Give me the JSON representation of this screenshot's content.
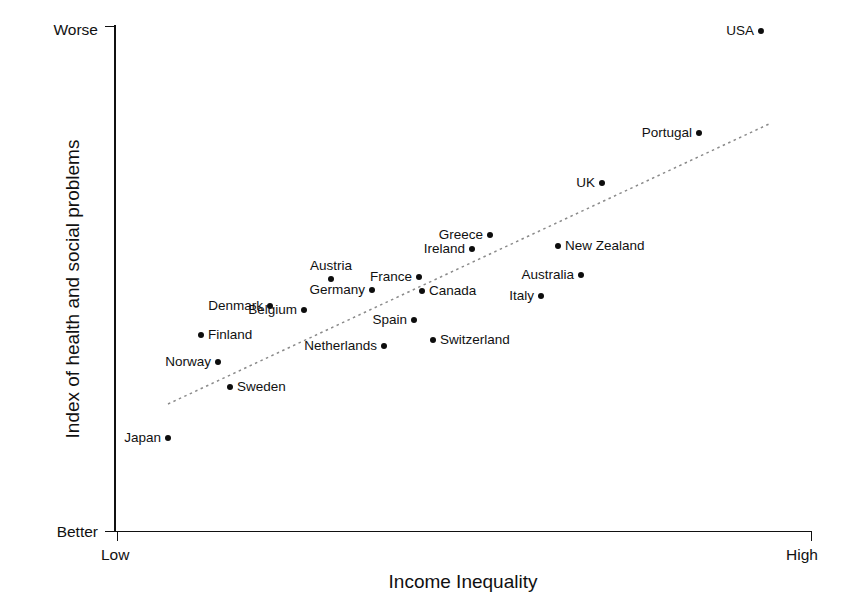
{
  "chart_data": {
    "type": "scatter",
    "title": "",
    "xlabel": "Income Inequality",
    "ylabel": "Index of health and social problems",
    "x_tick_labels": [
      "Low",
      "High"
    ],
    "y_tick_labels": [
      "Better",
      "Worse"
    ],
    "x_axis_direction": "Low to High",
    "y_axis_direction": "Better to Worse",
    "grid": false,
    "legend": false,
    "trend_line": {
      "style": "dotted",
      "description": "Positive linear regression line from lower-left to upper-right",
      "x_start_px": 168,
      "y_start_px": 404,
      "x_end_px": 769,
      "y_end_px": 124
    },
    "points": [
      {
        "name": "Japan",
        "x_px": 168,
        "y_px": 438,
        "label_side": "left",
        "x_rel": 0.077,
        "y_rel": 0.183
      },
      {
        "name": "Finland",
        "x_px": 201,
        "y_px": 335,
        "label_side": "right",
        "x_rel": 0.125,
        "y_rel": 0.387
      },
      {
        "name": "Norway",
        "x_px": 218,
        "y_px": 362,
        "label_side": "left",
        "x_rel": 0.149,
        "y_rel": 0.333
      },
      {
        "name": "Sweden",
        "x_px": 230,
        "y_px": 387,
        "label_side": "right",
        "x_rel": 0.166,
        "y_rel": 0.284
      },
      {
        "name": "Denmark",
        "x_px": 270,
        "y_px": 306,
        "label_side": "left",
        "x_rel": 0.223,
        "y_rel": 0.444
      },
      {
        "name": "Belgium",
        "x_px": 304,
        "y_px": 310,
        "label_side": "left",
        "x_rel": 0.272,
        "y_rel": 0.436
      },
      {
        "name": "Austria",
        "x_px": 331,
        "y_px": 279,
        "label_side": "above",
        "x_rel": 0.311,
        "y_rel": 0.498
      },
      {
        "name": "Germany",
        "x_px": 372,
        "y_px": 290,
        "label_side": "left",
        "x_rel": 0.37,
        "y_rel": 0.476
      },
      {
        "name": "Netherlands",
        "x_px": 384,
        "y_px": 346,
        "label_side": "left",
        "x_rel": 0.387,
        "y_rel": 0.365
      },
      {
        "name": "Spain",
        "x_px": 414,
        "y_px": 320,
        "label_side": "left",
        "x_rel": 0.43,
        "y_rel": 0.417
      },
      {
        "name": "France",
        "x_px": 419,
        "y_px": 277,
        "label_side": "left",
        "x_rel": 0.437,
        "y_rel": 0.502
      },
      {
        "name": "Canada",
        "x_px": 422,
        "y_px": 291,
        "label_side": "right",
        "x_rel": 0.441,
        "y_rel": 0.474
      },
      {
        "name": "Switzerland",
        "x_px": 433,
        "y_px": 340,
        "label_side": "right",
        "x_rel": 0.457,
        "y_rel": 0.377
      },
      {
        "name": "Ireland",
        "x_px": 472,
        "y_px": 249,
        "label_side": "left",
        "x_rel": 0.513,
        "y_rel": 0.557
      },
      {
        "name": "Greece",
        "x_px": 490,
        "y_px": 235,
        "label_side": "left",
        "x_rel": 0.539,
        "y_rel": 0.585
      },
      {
        "name": "Italy",
        "x_px": 541,
        "y_px": 296,
        "label_side": "left",
        "x_rel": 0.612,
        "y_rel": 0.464
      },
      {
        "name": "New Zealand",
        "x_px": 558,
        "y_px": 246,
        "label_side": "right",
        "x_rel": 0.636,
        "y_rel": 0.563
      },
      {
        "name": "Australia",
        "x_px": 581,
        "y_px": 275,
        "label_side": "left",
        "x_rel": 0.669,
        "y_rel": 0.506
      },
      {
        "name": "UK",
        "x_px": 602,
        "y_px": 183,
        "label_side": "left",
        "x_rel": 0.699,
        "y_rel": 0.688
      },
      {
        "name": "Portugal",
        "x_px": 699,
        "y_px": 133,
        "label_side": "left",
        "x_rel": 0.838,
        "y_rel": 0.787
      },
      {
        "name": "USA",
        "x_px": 761,
        "y_px": 31,
        "label_side": "left",
        "x_rel": 0.927,
        "y_rel": 0.988
      }
    ]
  },
  "axis": {
    "y_title": "Index of health and social problems",
    "x_title": "Income Inequality",
    "y_top_label": "Worse",
    "y_bottom_label": "Better",
    "x_left_label": "Low",
    "x_right_label": "High"
  },
  "colors": {
    "point": "#0d0d0d",
    "axis": "#111111",
    "trend": "#8a8a8a",
    "background": "#ffffff"
  }
}
